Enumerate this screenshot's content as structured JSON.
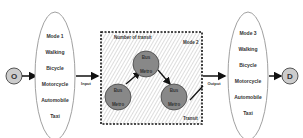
{
  "origin": {
    "label": "O"
  },
  "destination": {
    "label": "D"
  },
  "mode1": {
    "title": "Mode 1",
    "items": [
      "Walking",
      "Bicycle",
      "Motorcycle",
      "Automobile",
      "Taxi"
    ]
  },
  "mode3": {
    "title": "Mode 3",
    "items": [
      "Walking",
      "Bicycle",
      "Motorcycle",
      "Automobile",
      "Taxi"
    ]
  },
  "mode2": {
    "title": "Mode 2",
    "number_label": "Number of transit",
    "transit_label": "Transit",
    "nodes": [
      {
        "top": "Bus",
        "bottom": "Metro"
      },
      {
        "top": "Bus",
        "bottom": "Metro"
      },
      {
        "top": "Bus",
        "bottom": "Metro"
      }
    ]
  },
  "arrows": {
    "input": "Input",
    "output": "Output"
  }
}
